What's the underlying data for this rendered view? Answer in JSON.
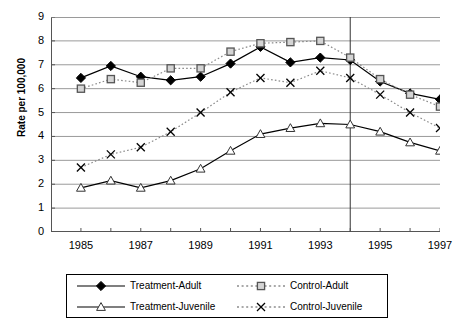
{
  "chart_data": {
    "type": "line",
    "title": "",
    "xlabel": "",
    "ylabel": "Rate per 100,000",
    "xlim": [
      1984,
      1997
    ],
    "ylim": [
      0,
      9
    ],
    "ytick_step": 1,
    "yticks": [
      0,
      1,
      2,
      3,
      4,
      5,
      6,
      7,
      8,
      9
    ],
    "x": [
      1985,
      1986,
      1987,
      1988,
      1989,
      1990,
      1991,
      1992,
      1993,
      1994,
      1995,
      1996,
      1997
    ],
    "xticks_labeled": [
      1985,
      1987,
      1989,
      1991,
      1993,
      1995,
      1997
    ],
    "xtick_labels": [
      "1985",
      "1987",
      "1989",
      "1991",
      "1993",
      "1995",
      "1997"
    ],
    "grid": "horizontal",
    "legend_position": "bottom",
    "annotations": [
      {
        "name": "intervention-line",
        "type": "vline",
        "x": 1994
      }
    ],
    "series": [
      {
        "name": "Treatment-Adult",
        "marker": "filled-diamond",
        "line": "solid",
        "color": "#000000",
        "values": [
          6.45,
          6.95,
          6.5,
          6.35,
          6.5,
          7.05,
          7.75,
          7.1,
          7.3,
          7.2,
          6.3,
          5.8,
          5.55
        ]
      },
      {
        "name": "Control-Adult",
        "marker": "open-square",
        "line": "dotted",
        "color": "#808080",
        "values": [
          6.0,
          6.4,
          6.25,
          6.85,
          6.85,
          7.55,
          7.9,
          7.95,
          8.0,
          7.3,
          6.4,
          5.75,
          5.25
        ]
      },
      {
        "name": "Treatment-Juvenile",
        "marker": "open-triangle",
        "line": "solid",
        "color": "#000000",
        "values": [
          1.85,
          2.15,
          1.85,
          2.15,
          2.65,
          3.4,
          4.1,
          4.35,
          4.55,
          4.5,
          4.2,
          3.75,
          3.4
        ]
      },
      {
        "name": "Control-Juvenile",
        "marker": "cross",
        "line": "dotted",
        "color": "#000000",
        "values": [
          2.7,
          3.25,
          3.55,
          4.2,
          5.0,
          5.85,
          6.45,
          6.25,
          6.75,
          6.45,
          5.75,
          5.0,
          4.35
        ]
      }
    ]
  },
  "legend": {
    "items": [
      {
        "label": "Treatment-Adult",
        "marker": "filled-diamond",
        "line": "solid"
      },
      {
        "label": "Control-Adult",
        "marker": "open-square",
        "line": "dotted"
      },
      {
        "label": "Treatment-Juvenile",
        "marker": "open-triangle",
        "line": "solid"
      },
      {
        "label": "Control-Juvenile",
        "marker": "cross",
        "line": "dotted"
      }
    ]
  }
}
